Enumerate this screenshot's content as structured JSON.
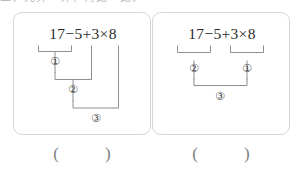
{
  "page": {
    "header_sliver_text": "二、先算一算，再比一比。",
    "line_color": "#8e8e92",
    "border_color": "#d6d6d8",
    "text_color": "#2b2b2b"
  },
  "problems": [
    {
      "id": "problem-1",
      "expression": "17−5+3×8",
      "operands": [
        "17",
        "5",
        "3",
        "8"
      ],
      "operators": [
        "−",
        "+",
        "×"
      ],
      "step_markers": [
        "①",
        "②",
        "③"
      ],
      "order_description": "左起依次计算：先 17−5，再加 3，最后乘 8",
      "answer": {
        "open_paren": "(",
        "value": "",
        "close_paren": ")"
      }
    },
    {
      "id": "problem-2",
      "expression": "17−5+3×8",
      "operands": [
        "17",
        "5",
        "3",
        "8"
      ],
      "operators": [
        "−",
        "+",
        "×"
      ],
      "step_markers": [
        "②",
        "①",
        "③"
      ],
      "order_description": "先算 3×8，再算 17−5，最后相加",
      "answer": {
        "open_paren": "(",
        "value": "",
        "close_paren": ")"
      }
    }
  ]
}
